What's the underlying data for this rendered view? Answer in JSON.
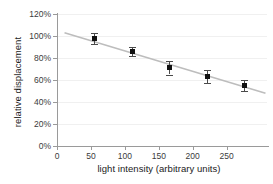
{
  "chart_data": {
    "type": "scatter",
    "title": "",
    "xlabel": "light intensity (arbitrary units)",
    "ylabel": "relative displacement",
    "x": [
      50,
      100,
      150,
      200,
      250
    ],
    "values": [
      98,
      86,
      71,
      63,
      55
    ],
    "errors": [
      5,
      4,
      6,
      6,
      5
    ],
    "series": [
      {
        "name": "relative displacement",
        "x": [
          50,
          100,
          150,
          200,
          250
        ],
        "values": [
          98,
          86,
          71,
          63,
          55
        ],
        "errors": [
          5,
          4,
          6,
          6,
          5
        ]
      }
    ],
    "trendline": {
      "type": "linear",
      "x_start": 10,
      "y_start": 103,
      "x_end": 278,
      "y_end": 48,
      "color": "#bdbdbd"
    },
    "xlim": [
      0,
      280
    ],
    "ylim": [
      0,
      120
    ],
    "xticks": [
      0,
      50,
      100,
      150,
      200,
      250
    ],
    "xtick_labels": [
      "0",
      "50",
      "100",
      "150",
      "200",
      "250"
    ],
    "yticks": [
      0,
      20,
      40,
      60,
      80,
      100,
      120
    ],
    "ytick_labels": [
      "0%",
      "20%",
      "40%",
      "60%",
      "80%",
      "100%",
      "120%"
    ],
    "grid": true,
    "legend": false,
    "marker_color": "#111111",
    "errorbar_color": "#4a4a4a",
    "axis_color": "#9a9a9a",
    "gridline_color": "#f0f0f0"
  },
  "axes": {
    "x_title": "light intensity (arbitrary units)",
    "y_title": "relative displacement"
  },
  "ytick_labels": {
    "t0": "0%",
    "t1": "20%",
    "t2": "40%",
    "t3": "60%",
    "t4": "80%",
    "t5": "100%",
    "t6": "120%"
  },
  "xtick_labels": {
    "t0": "0",
    "t1": "50",
    "t2": "100",
    "t3": "150",
    "t4": "200",
    "t5": "250"
  }
}
